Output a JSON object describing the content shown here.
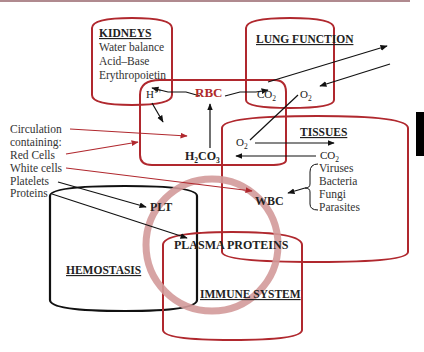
{
  "colors": {
    "red_outline": "#b0282e",
    "black_outline": "#111111",
    "circle_pink": "#d39a9a",
    "rbc_text": "#b02a2a",
    "top_rule": "#b08a8f",
    "text": "#222222"
  },
  "kidneys": {
    "title": "KIDNEYS",
    "items": [
      "Water balance",
      "Acid–Base",
      "Erythropoietin"
    ]
  },
  "lung": {
    "title": "LUNG FUNCTION"
  },
  "rbc": {
    "label": "RBC",
    "h_ion": "H",
    "h_ion_sup": "1+",
    "co2_main": "CO",
    "co2_sub": "2",
    "o2_main": "O",
    "o2_sub": "2",
    "h2co3_a": "H",
    "h2co3_sub1": "2",
    "h2co3_b": "CO",
    "h2co3_sub2": "3"
  },
  "tissues": {
    "title": "TISSUES",
    "o2_main": "O",
    "o2_sub": "2",
    "co2_main": "CO",
    "co2_sub": "2",
    "pathogens": [
      "Viruses",
      "Bacteria",
      "Fungi",
      "Parasites"
    ]
  },
  "circulation": {
    "lines": [
      "Circulation",
      "containing:",
      "Red Cells",
      "White cells",
      "Platelets",
      "Proteins"
    ]
  },
  "nodes": {
    "wbc": "WBC",
    "plt": "PLT",
    "plasma_proteins": "PLASMA PROTEINS"
  },
  "hemostasis": {
    "title": "HEMOSTASIS"
  },
  "immune": {
    "title": "IMMUNE SYSTEM"
  }
}
